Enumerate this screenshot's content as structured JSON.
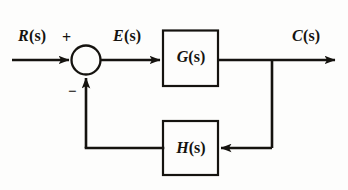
{
  "diagram": {
    "type": "closed-loop-feedback-block-diagram",
    "background_color": "#fdfdfc",
    "line_color": "#15130f",
    "signals": {
      "input": {
        "name": "R(s)",
        "var": "R",
        "arg": "(s)",
        "role": "reference-input"
      },
      "error": {
        "name": "E(s)",
        "var": "E",
        "arg": "(s)",
        "role": "error-signal"
      },
      "output": {
        "name": "C(s)",
        "var": "C",
        "arg": "(s)",
        "role": "controlled-output"
      }
    },
    "summing_junction": {
      "name": "summing-junction",
      "shape": "circle",
      "plus_sign": "+",
      "minus_sign": "−",
      "plus_input": "R(s)",
      "minus_input": "H(s) feedback"
    },
    "blocks": [
      {
        "id": "forward",
        "label_var": "G",
        "label_arg": "(s)",
        "label": "G(s)",
        "role": "forward-path-transfer-function"
      },
      {
        "id": "feedback",
        "label_var": "H",
        "label_arg": "(s)",
        "label": "H(s)",
        "role": "feedback-path-transfer-function"
      }
    ],
    "connections": [
      {
        "from": "R(s)",
        "to": "summing-junction",
        "direction": "right"
      },
      {
        "from": "summing-junction",
        "to": "G(s)",
        "label": "E(s)",
        "direction": "right"
      },
      {
        "from": "G(s)",
        "to": "C(s)",
        "direction": "right"
      },
      {
        "from": "output-takeoff",
        "to": "H(s)",
        "direction": "left"
      },
      {
        "from": "H(s)",
        "to": "summing-junction",
        "direction": "up"
      }
    ]
  }
}
